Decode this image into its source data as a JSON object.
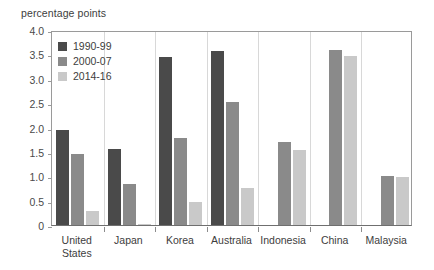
{
  "chart_data": {
    "type": "bar",
    "title": "",
    "subtitle": "",
    "xlabel": "",
    "ylabel": "percentage points",
    "ylim": [
      0,
      4.0
    ],
    "ytick_labels": [
      "4.0",
      "3.5",
      "3.0",
      "2.5",
      "2.0",
      "1.5",
      "1.0",
      "0.5",
      "0"
    ],
    "ytick_values": [
      4.0,
      3.5,
      3.0,
      2.5,
      2.0,
      1.5,
      1.0,
      0.5,
      0
    ],
    "grid": false,
    "legend_position": "top-left",
    "categories": [
      "United States",
      "Japan",
      "Korea",
      "Australia",
      "Indonesia",
      "China",
      "Malaysia"
    ],
    "category_label_lines": [
      [
        "United",
        "States"
      ],
      [
        "Japan"
      ],
      [
        "Korea"
      ],
      [
        "Australia"
      ],
      [
        "Indonesia"
      ],
      [
        "China"
      ],
      [
        "Malaysia"
      ]
    ],
    "series": [
      {
        "name": "1990-99",
        "color": "#4a4a4a",
        "values": [
          1.94,
          1.56,
          3.45,
          3.57,
          null,
          null,
          null
        ]
      },
      {
        "name": "2000-07",
        "color": "#8a8a8a",
        "values": [
          1.45,
          0.84,
          1.78,
          2.53,
          1.7,
          3.58,
          1.01
        ]
      },
      {
        "name": "2014-16",
        "color": "#c9c9c9",
        "values": [
          0.29,
          0.02,
          0.47,
          0.75,
          1.53,
          3.47,
          0.98
        ]
      }
    ]
  }
}
